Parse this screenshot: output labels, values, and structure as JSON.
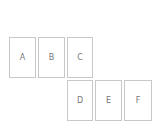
{
  "boxes": [
    {
      "label": "A",
      "x": 9,
      "y": 37,
      "w": 27,
      "h": 41
    },
    {
      "label": "B",
      "x": 38,
      "y": 37,
      "w": 27,
      "h": 41
    },
    {
      "label": "C",
      "x": 67,
      "y": 37,
      "w": 26,
      "h": 41
    },
    {
      "label": "D",
      "x": 67,
      "y": 80,
      "w": 26,
      "h": 41
    },
    {
      "label": "E",
      "x": 95,
      "y": 80,
      "w": 27,
      "h": 41
    },
    {
      "label": "F",
      "x": 124,
      "y": 80,
      "w": 28,
      "h": 41
    }
  ]
}
